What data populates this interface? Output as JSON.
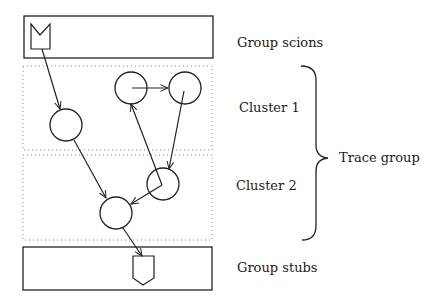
{
  "labels": {
    "group_scions": "Group scions",
    "cluster1": "Cluster 1",
    "cluster2": "Cluster 2",
    "trace_group": "Trace group",
    "group_stubs": "Group stubs"
  },
  "colors": {
    "stroke": "#222222",
    "dotted": "#888888",
    "background": "#ffffff"
  },
  "nodes": [
    {
      "id": "A",
      "cx": 66,
      "cy": 125,
      "r": 16,
      "cluster": 1
    },
    {
      "id": "B",
      "cx": 131,
      "cy": 88,
      "r": 16,
      "cluster": 1
    },
    {
      "id": "C",
      "cx": 185,
      "cy": 88,
      "r": 16,
      "cluster": 1
    },
    {
      "id": "D",
      "cx": 163,
      "cy": 184,
      "r": 16,
      "cluster": 2
    },
    {
      "id": "E",
      "cx": 116,
      "cy": 213,
      "r": 16,
      "cluster": 2
    }
  ],
  "edges": [
    {
      "from": "scion",
      "to": "A"
    },
    {
      "from": "B",
      "to": "C"
    },
    {
      "from": "C",
      "to": "D"
    },
    {
      "from": "D",
      "to": "B"
    },
    {
      "from": "D",
      "to": "E"
    },
    {
      "from": "A",
      "to": "E"
    },
    {
      "from": "E",
      "to": "stub"
    }
  ]
}
